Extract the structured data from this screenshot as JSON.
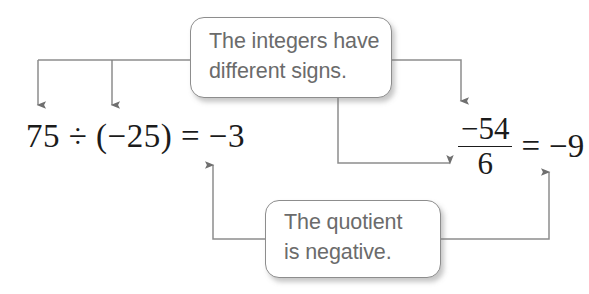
{
  "diagram": {
    "stroke_color": "#8d8d8d",
    "callout_text_color": "#6b6b6b",
    "math_text_color": "#1b1b1b",
    "background_color": "#ffffff"
  },
  "callouts": {
    "signs": {
      "name": "The integers have different signs.",
      "line1": "The integers have",
      "line2": "different signs."
    },
    "quotient": {
      "name": "The quotient is negative.",
      "line1": "The quotient",
      "line2": "is negative."
    }
  },
  "expressions": {
    "left": {
      "full": "75 ÷ (−25) = −3",
      "dividend": "75",
      "divisor": "(−25)",
      "quotient": "−3"
    },
    "right": {
      "full": "−54/6 = −9",
      "numerator": "−54",
      "denominator": "6",
      "relation": "=",
      "quotient": "−9"
    }
  },
  "connectors": [
    {
      "id": "signs-to-dividend",
      "from": "callout-signs",
      "to": "75",
      "arrow": "down"
    },
    {
      "id": "signs-to-divisor",
      "from": "callout-signs",
      "to": "(−25)",
      "arrow": "down"
    },
    {
      "id": "signs-to-numerator",
      "from": "callout-signs",
      "to": "−54",
      "arrow": "down"
    },
    {
      "id": "signs-to-denominator",
      "from": "callout-signs",
      "to": "6",
      "arrow": "right"
    },
    {
      "id": "quotient-to-left-result",
      "from": "callout-quotient",
      "to": "−3",
      "arrow": "up"
    },
    {
      "id": "quotient-to-right-result",
      "from": "callout-quotient",
      "to": "−9",
      "arrow": "up"
    }
  ]
}
